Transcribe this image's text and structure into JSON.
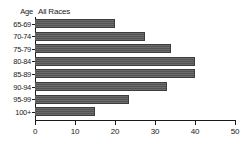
{
  "chart_data": {
    "type": "bar",
    "orientation": "horizontal",
    "title": "All Races",
    "xlabel": "",
    "ylabel": "Age",
    "categories": [
      "65-69",
      "70-74",
      "75-79",
      "80-84",
      "85-89",
      "90-94",
      "95-99",
      "100+"
    ],
    "values": [
      20,
      27.5,
      34,
      40,
      40,
      33,
      23.5,
      15
    ],
    "xlim": [
      0,
      50
    ],
    "xticks": [
      0,
      10,
      20,
      30,
      40,
      50
    ],
    "xtick_labels": [
      "0",
      "10",
      "20",
      "30",
      "40",
      "50"
    ],
    "grid": false,
    "legend": "none",
    "bar_color": "#595959",
    "axis_color": "#1a1a1a",
    "background": "#ffffff"
  },
  "header": {
    "age_label": "Age",
    "series_label": "All Races"
  }
}
